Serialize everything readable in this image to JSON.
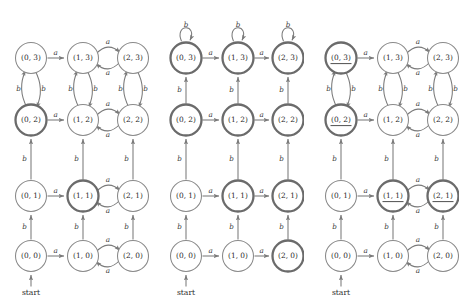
{
  "figure": {
    "type": "finite-automata-product-diagrams",
    "panel_count": 3,
    "background_color": "#ffffff",
    "node_stroke_color": "#8a8a8a",
    "accept_stroke_color": "#6b6b6b",
    "edge_color": "#7a7a7a",
    "label_color": "#2b2b2b",
    "alphabet": [
      "a",
      "b"
    ],
    "grid": {
      "columns": [
        "0",
        "1",
        "2"
      ],
      "rows": [
        "3",
        "2",
        "1",
        "0"
      ],
      "column_x": [
        31,
        83,
        133
      ],
      "row_y": [
        58,
        120,
        196,
        256
      ]
    }
  },
  "panels": [
    {
      "id": "panel-left",
      "origin_x": 0,
      "start_label": "start",
      "start_target": "(0,0)",
      "nodes": [
        {
          "id": "0-3",
          "label": "(0, 3)",
          "col": 0,
          "row": 0,
          "accept": false,
          "underline": false
        },
        {
          "id": "1-3",
          "label": "(1, 3)",
          "col": 1,
          "row": 0,
          "accept": false,
          "underline": false
        },
        {
          "id": "2-3",
          "label": "(2, 3)",
          "col": 2,
          "row": 0,
          "accept": false,
          "underline": false
        },
        {
          "id": "0-2",
          "label": "(0, 2)",
          "col": 0,
          "row": 1,
          "accept": true,
          "underline": false
        },
        {
          "id": "1-2",
          "label": "(1, 2)",
          "col": 1,
          "row": 1,
          "accept": false,
          "underline": false
        },
        {
          "id": "2-2",
          "label": "(2, 2)",
          "col": 2,
          "row": 1,
          "accept": false,
          "underline": false
        },
        {
          "id": "0-1",
          "label": "(0, 1)",
          "col": 0,
          "row": 2,
          "accept": false,
          "underline": false
        },
        {
          "id": "1-1",
          "label": "(1, 1)",
          "col": 1,
          "row": 2,
          "accept": true,
          "underline": false
        },
        {
          "id": "2-1",
          "label": "(2, 1)",
          "col": 2,
          "row": 2,
          "accept": false,
          "underline": false
        },
        {
          "id": "0-0",
          "label": "(0, 0)",
          "col": 0,
          "row": 3,
          "accept": false,
          "underline": false
        },
        {
          "id": "1-0",
          "label": "(1, 0)",
          "col": 1,
          "row": 3,
          "accept": false,
          "underline": false
        },
        {
          "id": "2-0",
          "label": "(2, 0)",
          "col": 2,
          "row": 3,
          "accept": false,
          "underline": false
        }
      ],
      "edges": [
        {
          "from": "0-3",
          "to": "1-3",
          "symbol": "a",
          "kind": "straight-h"
        },
        {
          "from": "1-3",
          "to": "2-3",
          "symbol": "a",
          "kind": "arc-h-up"
        },
        {
          "from": "2-3",
          "to": "1-3",
          "symbol": "a",
          "kind": "arc-h-down"
        },
        {
          "from": "0-2",
          "to": "1-2",
          "symbol": "a",
          "kind": "straight-h"
        },
        {
          "from": "1-2",
          "to": "2-2",
          "symbol": "a",
          "kind": "arc-h-up"
        },
        {
          "from": "2-2",
          "to": "1-2",
          "symbol": "a",
          "kind": "arc-h-down"
        },
        {
          "from": "0-1",
          "to": "1-1",
          "symbol": "a",
          "kind": "straight-h"
        },
        {
          "from": "1-1",
          "to": "2-1",
          "symbol": "a",
          "kind": "arc-h-up"
        },
        {
          "from": "2-1",
          "to": "1-1",
          "symbol": "a",
          "kind": "arc-h-down"
        },
        {
          "from": "0-0",
          "to": "1-0",
          "symbol": "a",
          "kind": "straight-h"
        },
        {
          "from": "1-0",
          "to": "2-0",
          "symbol": "a",
          "kind": "arc-h-up"
        },
        {
          "from": "2-0",
          "to": "1-0",
          "symbol": "a",
          "kind": "arc-h-down"
        },
        {
          "from": "0-2",
          "to": "0-3",
          "symbol": "b",
          "kind": "arc-v-left"
        },
        {
          "from": "0-3",
          "to": "0-2",
          "symbol": "b",
          "kind": "arc-v-right"
        },
        {
          "from": "1-2",
          "to": "1-3",
          "symbol": "b",
          "kind": "arc-v-left"
        },
        {
          "from": "1-3",
          "to": "1-2",
          "symbol": "b",
          "kind": "arc-v-right"
        },
        {
          "from": "2-2",
          "to": "2-3",
          "symbol": "b",
          "kind": "arc-v-left"
        },
        {
          "from": "2-3",
          "to": "2-2",
          "symbol": "b",
          "kind": "arc-v-right"
        },
        {
          "from": "0-1",
          "to": "0-2",
          "symbol": "b",
          "kind": "straight-v"
        },
        {
          "from": "1-1",
          "to": "1-2",
          "symbol": "b",
          "kind": "straight-v"
        },
        {
          "from": "2-1",
          "to": "2-2",
          "symbol": "b",
          "kind": "straight-v"
        },
        {
          "from": "0-0",
          "to": "0-1",
          "symbol": "b",
          "kind": "straight-v"
        },
        {
          "from": "1-0",
          "to": "1-1",
          "symbol": "b",
          "kind": "straight-v"
        },
        {
          "from": "2-0",
          "to": "2-1",
          "symbol": "b",
          "kind": "straight-v"
        }
      ]
    },
    {
      "id": "panel-middle",
      "origin_x": 155,
      "start_label": "start",
      "start_target": "(0,0)",
      "nodes": [
        {
          "id": "0-3",
          "label": "(0, 3)",
          "col": 0,
          "row": 0,
          "accept": true,
          "underline": false
        },
        {
          "id": "1-3",
          "label": "(1, 3)",
          "col": 1,
          "row": 0,
          "accept": true,
          "underline": false
        },
        {
          "id": "2-3",
          "label": "(2, 3)",
          "col": 2,
          "row": 0,
          "accept": true,
          "underline": false
        },
        {
          "id": "0-2",
          "label": "(0, 2)",
          "col": 0,
          "row": 1,
          "accept": true,
          "underline": false
        },
        {
          "id": "1-2",
          "label": "(1, 2)",
          "col": 1,
          "row": 1,
          "accept": true,
          "underline": false
        },
        {
          "id": "2-2",
          "label": "(2, 2)",
          "col": 2,
          "row": 1,
          "accept": true,
          "underline": false
        },
        {
          "id": "0-1",
          "label": "(0, 1)",
          "col": 0,
          "row": 2,
          "accept": false,
          "underline": false
        },
        {
          "id": "1-1",
          "label": "(1, 1)",
          "col": 1,
          "row": 2,
          "accept": true,
          "underline": false
        },
        {
          "id": "2-1",
          "label": "(2, 1)",
          "col": 2,
          "row": 2,
          "accept": true,
          "underline": false
        },
        {
          "id": "0-0",
          "label": "(0, 0)",
          "col": 0,
          "row": 3,
          "accept": false,
          "underline": false
        },
        {
          "id": "1-0",
          "label": "(1, 0)",
          "col": 1,
          "row": 3,
          "accept": false,
          "underline": false
        },
        {
          "id": "2-0",
          "label": "(2, 0)",
          "col": 2,
          "row": 3,
          "accept": true,
          "underline": false
        }
      ],
      "edges": [
        {
          "from": "0-3",
          "to": "1-3",
          "symbol": "a",
          "kind": "straight-h"
        },
        {
          "from": "1-3",
          "to": "2-3",
          "symbol": "a",
          "kind": "straight-h"
        },
        {
          "from": "0-2",
          "to": "1-2",
          "symbol": "a",
          "kind": "straight-h"
        },
        {
          "from": "1-2",
          "to": "2-2",
          "symbol": "a",
          "kind": "straight-h"
        },
        {
          "from": "0-1",
          "to": "1-1",
          "symbol": "a",
          "kind": "straight-h"
        },
        {
          "from": "1-1",
          "to": "2-1",
          "symbol": "a",
          "kind": "straight-h"
        },
        {
          "from": "0-0",
          "to": "1-0",
          "symbol": "a",
          "kind": "straight-h"
        },
        {
          "from": "1-0",
          "to": "2-0",
          "symbol": "a",
          "kind": "straight-h"
        },
        {
          "from": "2-3",
          "to": "2-3",
          "symbol": "a",
          "kind": "self-right"
        },
        {
          "from": "2-2",
          "to": "2-2",
          "symbol": "a",
          "kind": "self-right"
        },
        {
          "from": "2-1",
          "to": "2-1",
          "symbol": "a",
          "kind": "self-right"
        },
        {
          "from": "2-0",
          "to": "2-0",
          "symbol": "a",
          "kind": "self-right"
        },
        {
          "from": "0-3",
          "to": "0-3",
          "symbol": "b",
          "kind": "self-top"
        },
        {
          "from": "1-3",
          "to": "1-3",
          "symbol": "b",
          "kind": "self-top"
        },
        {
          "from": "2-3",
          "to": "2-3",
          "symbol": "b",
          "kind": "self-top"
        },
        {
          "from": "0-2",
          "to": "0-3",
          "symbol": "b",
          "kind": "straight-v"
        },
        {
          "from": "1-2",
          "to": "1-3",
          "symbol": "b",
          "kind": "straight-v"
        },
        {
          "from": "2-2",
          "to": "2-3",
          "symbol": "b",
          "kind": "straight-v"
        },
        {
          "from": "0-1",
          "to": "0-2",
          "symbol": "b",
          "kind": "straight-v"
        },
        {
          "from": "1-1",
          "to": "1-2",
          "symbol": "b",
          "kind": "straight-v"
        },
        {
          "from": "2-1",
          "to": "2-2",
          "symbol": "b",
          "kind": "straight-v"
        },
        {
          "from": "0-0",
          "to": "0-1",
          "symbol": "b",
          "kind": "straight-v"
        },
        {
          "from": "1-0",
          "to": "1-1",
          "symbol": "b",
          "kind": "straight-v"
        },
        {
          "from": "2-0",
          "to": "2-1",
          "symbol": "b",
          "kind": "straight-v"
        }
      ]
    },
    {
      "id": "panel-right",
      "origin_x": 310,
      "start_label": "start",
      "start_target": "(0,0)",
      "nodes": [
        {
          "id": "0-3",
          "label": "(0, 3)",
          "col": 0,
          "row": 0,
          "accept": true,
          "underline": true
        },
        {
          "id": "1-3",
          "label": "(1, 3)",
          "col": 1,
          "row": 0,
          "accept": false,
          "underline": false
        },
        {
          "id": "2-3",
          "label": "(2, 3)",
          "col": 2,
          "row": 0,
          "accept": false,
          "underline": false
        },
        {
          "id": "0-2",
          "label": "(0, 2)",
          "col": 0,
          "row": 1,
          "accept": true,
          "underline": true
        },
        {
          "id": "1-2",
          "label": "(1, 2)",
          "col": 1,
          "row": 1,
          "accept": false,
          "underline": false
        },
        {
          "id": "2-2",
          "label": "(2, 2)",
          "col": 2,
          "row": 1,
          "accept": false,
          "underline": false
        },
        {
          "id": "0-1",
          "label": "(0, 1)",
          "col": 0,
          "row": 2,
          "accept": false,
          "underline": false
        },
        {
          "id": "1-1",
          "label": "(1, 1)",
          "col": 1,
          "row": 2,
          "accept": true,
          "underline": true
        },
        {
          "id": "2-1",
          "label": "(2, 1)",
          "col": 2,
          "row": 2,
          "accept": true,
          "underline": true
        },
        {
          "id": "0-0",
          "label": "(0, 0)",
          "col": 0,
          "row": 3,
          "accept": false,
          "underline": false
        },
        {
          "id": "1-0",
          "label": "(1, 0)",
          "col": 1,
          "row": 3,
          "accept": false,
          "underline": false
        },
        {
          "id": "2-0",
          "label": "(2, 0)",
          "col": 2,
          "row": 3,
          "accept": false,
          "underline": false
        }
      ],
      "edges": [
        {
          "from": "0-3",
          "to": "1-3",
          "symbol": "a",
          "kind": "straight-h"
        },
        {
          "from": "1-3",
          "to": "2-3",
          "symbol": "a",
          "kind": "arc-h-up"
        },
        {
          "from": "2-3",
          "to": "1-3",
          "symbol": "a",
          "kind": "arc-h-down"
        },
        {
          "from": "0-2",
          "to": "1-2",
          "symbol": "a",
          "kind": "straight-h"
        },
        {
          "from": "1-2",
          "to": "2-2",
          "symbol": "a",
          "kind": "arc-h-up"
        },
        {
          "from": "2-2",
          "to": "1-2",
          "symbol": "a",
          "kind": "arc-h-down"
        },
        {
          "from": "0-1",
          "to": "1-1",
          "symbol": "a",
          "kind": "straight-h"
        },
        {
          "from": "1-1",
          "to": "2-1",
          "symbol": "a",
          "kind": "arc-h-up"
        },
        {
          "from": "2-1",
          "to": "1-1",
          "symbol": "a",
          "kind": "arc-h-down"
        },
        {
          "from": "0-0",
          "to": "1-0",
          "symbol": "a",
          "kind": "straight-h"
        },
        {
          "from": "1-0",
          "to": "2-0",
          "symbol": "a",
          "kind": "arc-h-up"
        },
        {
          "from": "2-0",
          "to": "1-0",
          "symbol": "a",
          "kind": "arc-h-down"
        },
        {
          "from": "0-2",
          "to": "0-3",
          "symbol": "b",
          "kind": "arc-v-left"
        },
        {
          "from": "0-3",
          "to": "0-2",
          "symbol": "b",
          "kind": "arc-v-right"
        },
        {
          "from": "1-2",
          "to": "1-3",
          "symbol": "b",
          "kind": "arc-v-left"
        },
        {
          "from": "1-3",
          "to": "1-2",
          "symbol": "b",
          "kind": "arc-v-right"
        },
        {
          "from": "2-2",
          "to": "2-3",
          "symbol": "b",
          "kind": "arc-v-left"
        },
        {
          "from": "2-3",
          "to": "2-2",
          "symbol": "b",
          "kind": "arc-v-right"
        },
        {
          "from": "0-1",
          "to": "0-2",
          "symbol": "b",
          "kind": "straight-v"
        },
        {
          "from": "1-1",
          "to": "1-2",
          "symbol": "b",
          "kind": "straight-v"
        },
        {
          "from": "2-1",
          "to": "2-2",
          "symbol": "b",
          "kind": "straight-v"
        },
        {
          "from": "0-0",
          "to": "0-1",
          "symbol": "b",
          "kind": "straight-v"
        },
        {
          "from": "1-0",
          "to": "1-1",
          "symbol": "b",
          "kind": "straight-v"
        },
        {
          "from": "2-0",
          "to": "2-1",
          "symbol": "b",
          "kind": "straight-v"
        }
      ]
    }
  ]
}
